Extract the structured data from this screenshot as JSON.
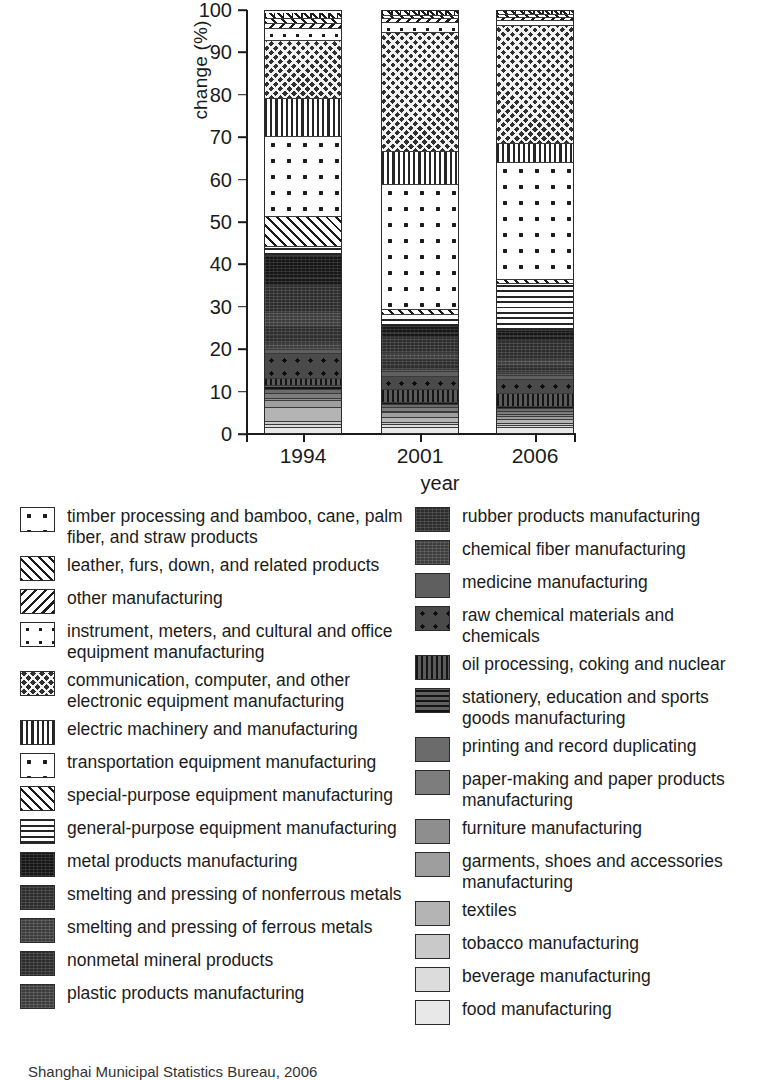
{
  "chart_data": {
    "type": "bar",
    "subtype": "stacked-100-percent",
    "title": "",
    "xlabel": "year",
    "ylabel": "change (%)",
    "categories": [
      "1994",
      "2001",
      "2006"
    ],
    "yticks": [
      0,
      10,
      20,
      30,
      40,
      50,
      60,
      70,
      80,
      90,
      100
    ],
    "ylim": [
      0,
      100
    ],
    "grid": false,
    "legend_position": "below",
    "series": [
      {
        "name": "food manufacturing",
        "pattern": "solid-gray-12",
        "values": [
          1.2,
          1.3,
          1.2
        ]
      },
      {
        "name": "beverage manufacturing",
        "pattern": "solid-gray-11",
        "values": [
          0.8,
          0.7,
          0.6
        ]
      },
      {
        "name": "tobacco manufacturing",
        "pattern": "solid-gray-10",
        "values": [
          0.6,
          0.5,
          0.4
        ]
      },
      {
        "name": "textiles",
        "pattern": "solid-gray-9",
        "values": [
          3.4,
          1.4,
          1.0
        ]
      },
      {
        "name": "garments, shoes and accessories manufacturing",
        "pattern": "solid-gray-8",
        "values": [
          1.6,
          1.1,
          0.9
        ]
      },
      {
        "name": "furniture manufacturing",
        "pattern": "solid-gray-7",
        "values": [
          0.5,
          0.4,
          0.4
        ]
      },
      {
        "name": "paper-making and paper products manufacturing",
        "pattern": "solid-gray-6",
        "values": [
          1.2,
          0.9,
          0.8
        ]
      },
      {
        "name": "printing and record duplicating",
        "pattern": "solid-gray-5",
        "values": [
          0.9,
          0.7,
          0.6
        ]
      },
      {
        "name": "stationery, education and sports goods manufacturing",
        "pattern": "horiz-dark",
        "values": [
          0.9,
          0.7,
          0.6
        ]
      },
      {
        "name": "oil processing, coking and nuclear",
        "pattern": "vert-dark",
        "values": [
          1.7,
          3.3,
          3.1
        ]
      },
      {
        "name": "raw chemical materials and chemicals",
        "pattern": "dots-dark",
        "values": [
          5.8,
          3.4,
          3.6
        ]
      },
      {
        "name": "medicine manufacturing",
        "pattern": "solid-gray-4",
        "values": [
          1.1,
          1.2,
          1.1
        ]
      },
      {
        "name": "chemical fiber manufacturing",
        "pattern": "noise-mid",
        "values": [
          1.6,
          0.6,
          0.4
        ]
      },
      {
        "name": "rubber products manufacturing",
        "pattern": "noise-dark",
        "values": [
          1.5,
          0.8,
          0.6
        ]
      },
      {
        "name": "plastic products manufacturing",
        "pattern": "noise-dark-2",
        "values": [
          2.3,
          1.6,
          1.3
        ]
      },
      {
        "name": "nonmetal mineral products",
        "pattern": "noise-mid-2",
        "values": [
          3.2,
          1.9,
          1.5
        ]
      },
      {
        "name": "smelting and pressing of ferrous metals",
        "pattern": "noise-dark-3",
        "values": [
          6.5,
          3.7,
          4.8
        ]
      },
      {
        "name": "smelting and pressing of nonferrous metals",
        "pattern": "noise-dark-4",
        "values": [
          1.5,
          1.1,
          1.0
        ]
      },
      {
        "name": "metal products manufacturing",
        "pattern": "noise-darkest",
        "values": [
          5.5,
          1.8,
          1.5
        ]
      },
      {
        "name": "general-purpose equipment manufacturing",
        "pattern": "horiz",
        "values": [
          2.1,
          3.0,
          11.8
        ]
      },
      {
        "name": "special-purpose equipment manufacturing",
        "pattern": "diag-back",
        "values": [
          7.0,
          1.3,
          1.0
        ]
      },
      {
        "name": "transportation equipment manufacturing",
        "pattern": "dots-sparse-lg",
        "values": [
          19.0,
          32.5,
          29.5
        ]
      },
      {
        "name": "electric machinery and manufacturing",
        "pattern": "vert",
        "values": [
          9.0,
          8.6,
          4.8
        ]
      },
      {
        "name": "communication, computer, and other electronic equipment manufacturing",
        "pattern": "crosshatch",
        "values": [
          13.5,
          30.9,
          29.7
        ]
      },
      {
        "name": "instrument, meters, and cultural and office equipment manufacturing",
        "pattern": "dots-sparse-sm",
        "values": [
          3.0,
          2.6,
          1.4
        ]
      },
      {
        "name": "other manufacturing",
        "pattern": "diag-fwd",
        "values": [
          1.1,
          0.9,
          0.7
        ]
      },
      {
        "name": "leather, furs, down, and related products",
        "pattern": "diag-back-2",
        "values": [
          1.2,
          0.8,
          0.7
        ]
      },
      {
        "name": "timber processing and bamboo, cane, palm fiber, and straw products",
        "pattern": "mix-top",
        "values": [
          1.3,
          1.3,
          1.0
        ]
      }
    ]
  },
  "legend": {
    "left_column": [
      {
        "label": "timber processing and bamboo, cane, palm fiber, and straw products",
        "pattern": "dots-sparse-lg"
      },
      {
        "label": "leather, furs, down, and related products",
        "pattern": "diag-back"
      },
      {
        "label": "other manufacturing",
        "pattern": "diag-fwd"
      },
      {
        "label": "instrument, meters, and cultural and office equipment manufacturing",
        "pattern": "dots-sparse-sm"
      },
      {
        "label": "communication, computer, and other electronic equipment manufacturing",
        "pattern": "crosshatch"
      },
      {
        "label": "electric machinery and manufacturing",
        "pattern": "vert"
      },
      {
        "label": "transportation equipment manufacturing",
        "pattern": "dots-sparse-lg"
      },
      {
        "label": "special-purpose equipment manufacturing",
        "pattern": "diag-back"
      },
      {
        "label": "general-purpose equipment manufacturing",
        "pattern": "horiz"
      },
      {
        "label": "metal products manufacturing",
        "pattern": "noise-darkest"
      },
      {
        "label": "smelting and pressing of nonferrous metals",
        "pattern": "noise-dark"
      },
      {
        "label": "smelting and pressing of ferrous metals",
        "pattern": "noise-mid"
      },
      {
        "label": "nonmetal mineral products",
        "pattern": "noise-dark"
      },
      {
        "label": "plastic products manufacturing",
        "pattern": "noise-mid"
      }
    ],
    "right_column": [
      {
        "label": "rubber products manufacturing",
        "pattern": "noise-dark"
      },
      {
        "label": "chemical fiber manufacturing",
        "pattern": "noise-mid"
      },
      {
        "label": "medicine manufacturing",
        "pattern": "solid-gray-4"
      },
      {
        "label": "raw chemical materials and chemicals",
        "pattern": "dots-dark"
      },
      {
        "label": "oil processing, coking and nuclear",
        "pattern": "vert-dark"
      },
      {
        "label": "stationery, education and sports goods manufacturing",
        "pattern": "horiz-dark"
      },
      {
        "label": "printing and record duplicating",
        "pattern": "solid-gray-5"
      },
      {
        "label": "paper-making and paper products manufacturing",
        "pattern": "solid-gray-6"
      },
      {
        "label": "furniture manufacturing",
        "pattern": "solid-gray-7"
      },
      {
        "label": "garments, shoes and accessories manufacturing",
        "pattern": "solid-gray-8"
      },
      {
        "label": "textiles",
        "pattern": "solid-gray-9"
      },
      {
        "label": "tobacco manufacturing",
        "pattern": "solid-gray-10"
      },
      {
        "label": "beverage manufacturing",
        "pattern": "solid-gray-11"
      },
      {
        "label": "food manufacturing",
        "pattern": "solid-gray-12"
      }
    ]
  },
  "source_note": "Shanghai Municipal Statistics Bureau, 2006"
}
